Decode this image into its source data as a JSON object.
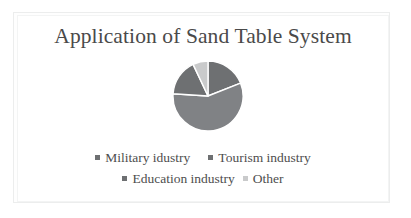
{
  "chart_data": {
    "type": "pie",
    "title": "Application of Sand Table System",
    "categories": [
      "Military idustry",
      "Tourism industry",
      "Education industry",
      "Other"
    ],
    "values": [
      19,
      57,
      17,
      7
    ],
    "units": "percent",
    "colors": [
      "#6e7072",
      "#808285",
      "#6e7072",
      "#c9cacb"
    ],
    "slice_border_color": "#ffffff",
    "start_angle_deg": 0,
    "direction": "clockwise",
    "legend_position": "bottom",
    "grid": false,
    "xlabel": "",
    "ylabel": "",
    "series": [
      {
        "name": "Application of Sand Table System",
        "values": [
          19,
          57,
          17,
          7
        ]
      }
    ],
    "slices": [
      {
        "label": "Military idustry",
        "value": 19,
        "color": "#6e7072",
        "start_deg": 296,
        "end_deg": 360
      },
      {
        "label": "Tourism industry",
        "value": 57,
        "color": "#808285",
        "start_deg": 2,
        "end_deg": 207
      },
      {
        "label": "Education industry",
        "value": 17,
        "color": "#6e7072",
        "start_deg": 209,
        "end_deg": 270
      },
      {
        "label": "Other",
        "value": 7,
        "color": "#c9cacb",
        "start_deg": 272,
        "end_deg": 294
      }
    ]
  },
  "figure": {
    "background_color": "#ffffff",
    "frame_color": "#eceded"
  },
  "title": {
    "text": "Application of Sand Table System",
    "color": "#4a4a4a"
  },
  "legend": {
    "rows": [
      [
        {
          "label": "Military idustry",
          "color": "#6e7072"
        },
        {
          "label": "Tourism industry",
          "color": "#6e7072"
        }
      ],
      [
        {
          "label": "Education industry",
          "color": "#6e7072"
        },
        {
          "label": "Other",
          "color": "#c9cacb"
        }
      ]
    ]
  }
}
